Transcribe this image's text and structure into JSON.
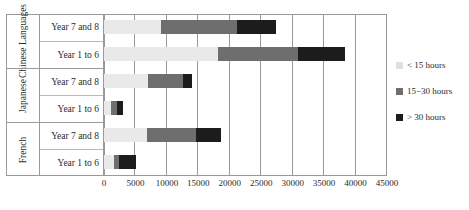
{
  "chart_data": {
    "type": "bar",
    "orientation": "horizontal",
    "stacked": true,
    "title": "",
    "xlabel": "",
    "ylabel": "",
    "xlim": [
      0,
      45000
    ],
    "xticks": [
      0,
      5000,
      10000,
      15000,
      20000,
      25000,
      30000,
      35000,
      40000,
      45000
    ],
    "xtick_labels": [
      "0",
      "5000",
      "10000",
      "15000",
      "20000",
      "25000",
      "30000",
      "35000",
      "40000",
      "45000"
    ],
    "grid": true,
    "legend_position": "right",
    "categories": [
      "Chinese Languages - Year 7 and 8",
      "Chinese Languages - Year 1 to 6",
      "Japanese - Year 7 and 8",
      "Japanese - Year 1 to 6",
      "French - Year 7 and 8",
      "French - Year 1 to 6"
    ],
    "series": [
      {
        "name": "< 15 hours",
        "color": "#e9e9e9",
        "values": [
          9050,
          18150,
          6980,
          1070,
          6820,
          1550
        ]
      },
      {
        "name": "15−30 hours",
        "color": "#6e6e6e",
        "values": [
          12150,
          12650,
          5590,
          960,
          7830,
          800
        ]
      },
      {
        "name": "> 30 hours",
        "color": "#1c1c1c",
        "values": [
          6200,
          7500,
          1430,
          970,
          4000,
          2700
        ]
      }
    ],
    "totals": [
      27400,
      38300,
      14000,
      3000,
      18650,
      5050
    ]
  },
  "axis": {
    "groups": [
      {
        "label": "Chinese Languages",
        "rows": [
          "Year 7 and 8",
          "Year 1 to 6"
        ]
      },
      {
        "label": "Japanese",
        "rows": [
          "Year 7 and 8",
          "Year 1 to 6"
        ]
      },
      {
        "label": "French",
        "rows": [
          "Year 7 and 8",
          "Year 1 to 6"
        ]
      }
    ],
    "xticks": [
      "0",
      "5000",
      "10000",
      "15000",
      "20000",
      "25000",
      "30000",
      "35000",
      "40000",
      "45000"
    ]
  },
  "legend": {
    "items": [
      {
        "label": "< 15 hours",
        "color": "#e0e0e0"
      },
      {
        "label": "15−30 hours",
        "color": "#6e6e6e"
      },
      {
        "label": "> 30 hours",
        "color": "#1c1c1c"
      }
    ]
  }
}
